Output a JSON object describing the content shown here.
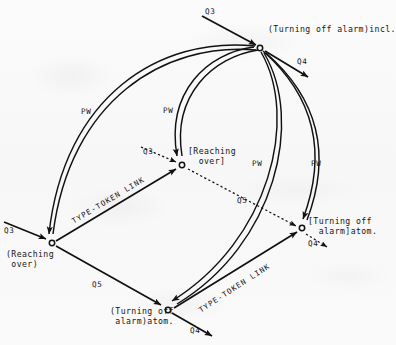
{
  "diagram": {
    "background_color": "#fafafa",
    "ink_color": "#111111",
    "nodes": [
      {
        "id": "turning-off-alarm-incl",
        "label": "(Turning off alarm)incl.",
        "x": 260,
        "y": 48,
        "label_x": 268,
        "label_y": 25
      },
      {
        "id": "reaching-over-token",
        "label": "[Reaching\n  over]",
        "x": 182,
        "y": 165,
        "label_x": 188,
        "label_y": 147
      },
      {
        "id": "reaching-over-type",
        "label": "(Reaching\n over)",
        "x": 52,
        "y": 243,
        "label_x": 6,
        "label_y": 250
      },
      {
        "id": "turning-off-alarm-atom-token",
        "label": "[Turning off\n  alarm]atom.",
        "x": 302,
        "y": 228,
        "label_x": 308,
        "label_y": 217
      },
      {
        "id": "turning-off-alarm-atom-type",
        "label": "(Turning off\n alarm)atom.",
        "x": 168,
        "y": 310,
        "label_x": 110,
        "label_y": 307
      }
    ],
    "edge_labels": [
      {
        "id": "q3-top",
        "text": "Q3",
        "x": 205,
        "y": 8
      },
      {
        "id": "q4-top",
        "text": "Q4",
        "x": 297,
        "y": 58
      },
      {
        "id": "pw-left",
        "text": "PW",
        "x": 81,
        "y": 108
      },
      {
        "id": "pw-mid",
        "text": "PW",
        "x": 163,
        "y": 107
      },
      {
        "id": "pw-right1",
        "text": "PW",
        "x": 252,
        "y": 160
      },
      {
        "id": "pw-right2",
        "text": "PW",
        "x": 311,
        "y": 160
      },
      {
        "id": "q3-mid",
        "text": "Q3",
        "x": 143,
        "y": 148
      },
      {
        "id": "q5-mid",
        "text": "Q5",
        "x": 237,
        "y": 197
      },
      {
        "id": "q3-left",
        "text": "Q3",
        "x": 4,
        "y": 227
      },
      {
        "id": "q4-right",
        "text": "Q4",
        "x": 308,
        "y": 240
      },
      {
        "id": "q5-bottom",
        "text": "Q5",
        "x": 92,
        "y": 281
      },
      {
        "id": "q4-bottom",
        "text": "Q4",
        "x": 190,
        "y": 327
      }
    ],
    "link_labels": [
      {
        "id": "type-token-link-upper",
        "text": "TYPE-TOKEN LINK",
        "x": 73,
        "y": 218,
        "rotate": -31
      },
      {
        "id": "type-token-link-lower",
        "text": "TYPE-TOKEN LINK",
        "x": 200,
        "y": 307,
        "rotate": -33
      }
    ]
  }
}
